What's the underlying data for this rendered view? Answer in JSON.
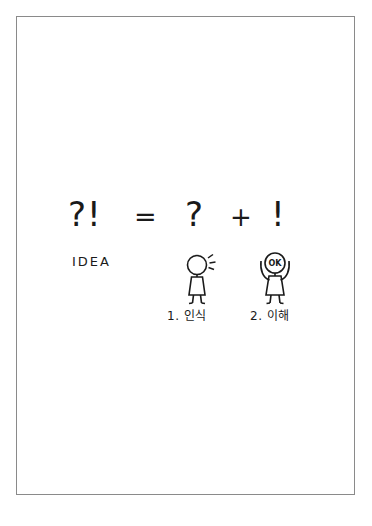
{
  "page": {
    "background_color": "#ffffff",
    "frame_color": "#8a8a8a",
    "ink_color": "#1a1a1a"
  },
  "equation": {
    "lhs": "?!",
    "operator_equals": "=",
    "term_1": "?",
    "operator_plus": "+",
    "term_2": "!"
  },
  "labels": {
    "idea": "IDEA"
  },
  "figures": [
    {
      "id": "figure-1",
      "caption": "1. 인식",
      "head_text": "",
      "pose": "standing-with-idea-sparks",
      "sparks": 3
    },
    {
      "id": "figure-2",
      "caption": "2. 이해",
      "head_text": "OK",
      "pose": "arms-raised",
      "sparks": 0
    }
  ]
}
